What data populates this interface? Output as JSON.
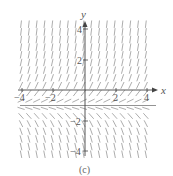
{
  "figure": {
    "caption": "(c)",
    "type": "slope field",
    "x_axis": {
      "label": "x",
      "ticks": [
        -4,
        -2,
        2,
        4
      ],
      "range": [
        -4.3,
        4.3
      ]
    },
    "y_axis": {
      "label": "y",
      "ticks": [
        4,
        2,
        -2,
        -4
      ],
      "range": [
        -4.6,
        4.6
      ]
    },
    "equilibrium_line_y": -1,
    "colors": {
      "segments": "#8a8a8a",
      "axes": "#444444",
      "equilibrium": "#777777"
    }
  },
  "chart_data": {
    "type": "slope-field",
    "title": "(c)",
    "xlabel": "x",
    "ylabel": "y",
    "xlim": [
      -4,
      4
    ],
    "ylim": [
      -4,
      4
    ],
    "xticks": [
      -4,
      -2,
      2,
      4
    ],
    "yticks": [
      -4,
      -2,
      2,
      4
    ],
    "equilibrium": {
      "y": -1,
      "style": "horizontal line"
    },
    "slope_behavior": {
      "above_equilibrium": "positive slopes, increasing steepness as y increases",
      "below_equilibrium": "negative slopes, increasing steepness as y decreases",
      "independent_of_x": true
    },
    "grid": false
  }
}
